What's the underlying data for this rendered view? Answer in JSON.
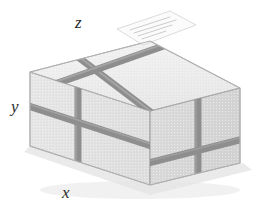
{
  "figure": {
    "name": "strapped-carton-axonometric",
    "caption": "",
    "background": "#ffffff"
  },
  "axes": {
    "labels": [
      {
        "name": "z",
        "text": "z",
        "position": "top"
      },
      {
        "name": "y",
        "text": "y",
        "position": "left"
      },
      {
        "name": "x",
        "text": "x",
        "position": "bottom"
      }
    ]
  },
  "box": {
    "faces": [
      {
        "name": "top-face",
        "fill": "#eeeeee",
        "stroke": "#b9b9b9"
      },
      {
        "name": "left-face",
        "fill": "#e3e3e3",
        "stroke": "#b9b9b9"
      },
      {
        "name": "right-face",
        "fill": "#d9d9d9",
        "stroke": "#b9b9b9"
      }
    ],
    "edge_color": "#b3b3b3",
    "shadow_color": "#d7d7d7"
  },
  "straps": {
    "color": "#8e8e8e",
    "highlight": "#a6a6a6",
    "count": 2,
    "width_px": 7,
    "description": "two bands crossing over the top face"
  },
  "shipping_label": {
    "name": "shipping-label",
    "fill": "#fbfbfb",
    "stroke": "#d0d0d0",
    "text_lines": [
      "",
      "",
      "",
      ""
    ],
    "text_color": "#c2c2c2"
  }
}
